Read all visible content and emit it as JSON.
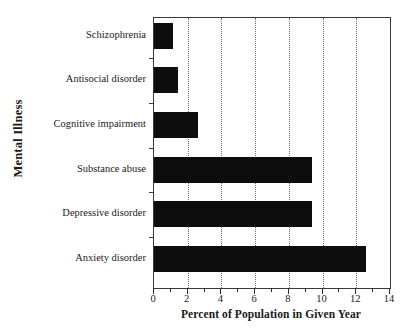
{
  "chart_data": {
    "type": "bar",
    "orientation": "horizontal",
    "title": "",
    "xlabel": "Percent of Population in Given Year",
    "ylabel": "Mental Illness",
    "categories": [
      "Schizophrenia",
      "Antisocial disorder",
      "Cognitive impairment",
      "Substance abuse",
      "Depressive disorder",
      "Anxiety disorder"
    ],
    "values": [
      1.1,
      1.4,
      2.6,
      9.4,
      9.4,
      12.6
    ],
    "xlim": [
      0,
      14
    ],
    "x_ticks": [
      0,
      2,
      4,
      6,
      8,
      10,
      12,
      14
    ],
    "x_tick_labels": [
      "0",
      "2",
      "4",
      "6",
      "8",
      "10",
      "12",
      "14"
    ],
    "x_minor_ticks": [
      1,
      3,
      5,
      7,
      9,
      11,
      13
    ],
    "gridlines": [
      2,
      4,
      6,
      8,
      10,
      12
    ],
    "grid": true,
    "grid_style": "dotted",
    "legend": null,
    "bar_color": "#0d0d0d",
    "grid_color": "#6b6b6b",
    "axis_color": "#3a3a3a",
    "background": "#ffffff"
  }
}
